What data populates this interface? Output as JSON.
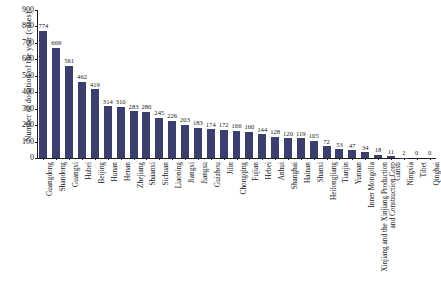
{
  "chart_data": {
    "type": "bar",
    "title": "",
    "xlabel": "",
    "ylabel": "Number of donation of the year (cases)",
    "ylim": [
      0,
      900
    ],
    "ytick_step": 100,
    "yticks": [
      "0",
      "100",
      "200",
      "300",
      "400",
      "500",
      "600",
      "700",
      "800",
      "900"
    ],
    "grid": false,
    "legend": null,
    "bar_color": "#3b3f6d",
    "axis_color": "#1b1b20",
    "label_rotation_deg": -90,
    "categories": [
      "Guangdong",
      "Shandong",
      "Guangxi",
      "Hubei",
      "Beijing",
      "Hunan",
      "Henan",
      "Zhejiang",
      "Shaanxi",
      "Sichuan",
      "Liaoning",
      "Jiangxi",
      "Jiangsu",
      "Guizhou",
      "Jilin",
      "Chongqing",
      "Fujian",
      "Hebei",
      "Anhui",
      "Shanghai",
      "Hainan",
      "Shanxi",
      "Heilongjiang",
      "Tianjin",
      "Yunnan",
      "Inner Mongolia",
      "Xinjiang and the Xinjiang Production and Construction Corp",
      "Gansu",
      "Ningxia",
      "Tibet",
      "Qinghai"
    ],
    "values": [
      774,
      669,
      561,
      462,
      419,
      314,
      310,
      283,
      280,
      245,
      226,
      203,
      183,
      174,
      172,
      166,
      160,
      144,
      128,
      120,
      119,
      105,
      72,
      53,
      47,
      34,
      18,
      11,
      2,
      0,
      0
    ],
    "value_labels": [
      "774",
      "669",
      "561",
      "462",
      "419",
      "314",
      "310",
      "283",
      "280",
      "245",
      "226",
      "203",
      "183",
      "174",
      "172",
      "166",
      "160",
      "144",
      "128",
      "120",
      "119",
      "105",
      "72",
      "53",
      "47",
      "34",
      "18",
      "11",
      "2",
      "0",
      "0"
    ]
  }
}
